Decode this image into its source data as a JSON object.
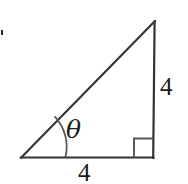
{
  "figure": {
    "kind": "right-triangle-diagram",
    "background_color": "#ffffff",
    "stroke_color": "#333333",
    "label_color": "#1b1b1b",
    "labels": {
      "angle": "θ",
      "side_right": "4",
      "side_bottom": "4"
    },
    "geometry": {
      "vertex_bottom_left": [
        21,
        158
      ],
      "vertex_bottom_right": [
        153,
        158
      ],
      "vertex_apex": [
        155,
        21
      ],
      "right_angle_marker": {
        "corner": [
          153,
          158
        ],
        "size": 19
      },
      "angle_arc": {
        "center": [
          21,
          158
        ],
        "radius": 44,
        "from": [
          55,
          116
        ],
        "to": [
          65,
          157
        ]
      }
    },
    "artifact": {
      "name": "scan-speck",
      "position": [
        1,
        30
      ],
      "size": [
        2,
        5
      ],
      "color": "#2b2b2b"
    }
  }
}
